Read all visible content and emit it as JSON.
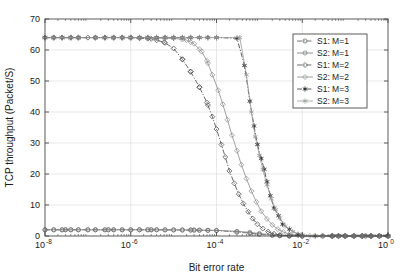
{
  "chart_data": {
    "type": "line",
    "title": "",
    "xlabel": "Bit error rate",
    "ylabel": "TCP throughput (Packet/S)",
    "xscale": "log",
    "yscale": "linear",
    "xlim": [
      1e-08,
      1
    ],
    "ylim": [
      0,
      70
    ],
    "grid": true,
    "legend_position": "upper-right",
    "xticks": [
      {
        "value": 1e-08,
        "label": "10",
        "exponent": "-8"
      },
      {
        "value": 1e-06,
        "label": "10",
        "exponent": "-6"
      },
      {
        "value": 0.0001,
        "label": "10",
        "exponent": "-4"
      },
      {
        "value": 0.01,
        "label": "10",
        "exponent": "-2"
      },
      {
        "value": 1,
        "label": "10",
        "exponent": "0"
      }
    ],
    "yticks": [
      0,
      10,
      20,
      30,
      40,
      50,
      60,
      70
    ],
    "plateau_value": 64,
    "series": [
      {
        "name": "S1: M=1",
        "marker": "circle",
        "filled": false,
        "linestyle": "dashdot",
        "color": "#555555",
        "x": [
          1e-08,
          3e-08,
          1e-07,
          3e-07,
          1e-06,
          3e-06,
          1e-05,
          3e-05,
          0.0001,
          0.0003,
          0.0006,
          0.001,
          0.002,
          0.003,
          0.005,
          0.01,
          0.03,
          0.1,
          0.3,
          1
        ],
        "y": [
          2.0,
          2.0,
          2.0,
          2.0,
          2.0,
          2.0,
          1.95,
          1.9,
          1.75,
          1.3,
          0.9,
          0.55,
          0.2,
          0.08,
          0.02,
          0,
          0,
          0,
          0,
          0
        ]
      },
      {
        "name": "S2: M=1",
        "marker": "circle",
        "filled": false,
        "linestyle": "solid",
        "color": "#777777",
        "x": [
          1e-08,
          3e-08,
          1e-07,
          3e-07,
          1e-06,
          3e-06,
          1e-05,
          3e-05,
          0.0001,
          0.0003,
          0.0006,
          0.001,
          0.002,
          0.003,
          0.005,
          0.01,
          0.03,
          0.1,
          0.3,
          1
        ],
        "y": [
          2.0,
          2.0,
          2.0,
          2.0,
          2.0,
          2.0,
          1.98,
          1.93,
          1.82,
          1.5,
          1.15,
          0.8,
          0.35,
          0.15,
          0.05,
          0,
          0,
          0,
          0,
          0
        ]
      },
      {
        "name": "S1: M=2",
        "marker": "diamond",
        "filled": false,
        "linestyle": "dashdot",
        "color": "#444444",
        "x": [
          1e-08,
          1e-07,
          1e-06,
          3e-06,
          6e-06,
          1e-05,
          1.6e-05,
          2.5e-05,
          4e-05,
          6e-05,
          8e-05,
          0.0001,
          0.00013,
          0.00016,
          0.0002,
          0.00026,
          0.00033,
          0.00042,
          0.00055,
          0.0007,
          0.0009,
          0.0012,
          0.0016,
          0.0022,
          0.003,
          0.005,
          0.01,
          0.1,
          1
        ],
        "y": [
          64,
          64,
          64,
          63.6,
          62.5,
          60.5,
          57.0,
          53.0,
          48.0,
          43.0,
          38.5,
          34.5,
          29.5,
          25.5,
          21.0,
          17.0,
          13.5,
          10.5,
          7.8,
          5.6,
          3.8,
          2.4,
          1.4,
          0.7,
          0.3,
          0.05,
          0,
          0,
          0
        ]
      },
      {
        "name": "S2: M=2",
        "marker": "diamond",
        "filled": false,
        "linestyle": "solid",
        "color": "#8a8a8a",
        "x": [
          1e-08,
          1e-07,
          1e-06,
          1e-05,
          2e-05,
          3e-05,
          4.5e-05,
          6e-05,
          8e-05,
          0.00011,
          0.00014,
          0.00018,
          0.00023,
          0.0003,
          0.00038,
          0.0005,
          0.00065,
          0.00085,
          0.0011,
          0.0015,
          0.002,
          0.0027,
          0.0036,
          0.005,
          0.008,
          0.015,
          0.1,
          1
        ],
        "y": [
          64,
          64,
          64,
          63.8,
          63.2,
          62.0,
          59.5,
          56.5,
          52.0,
          47.0,
          42.5,
          37.5,
          32.5,
          27.5,
          23.0,
          18.5,
          14.5,
          11.0,
          8.0,
          5.5,
          3.6,
          2.2,
          1.3,
          0.6,
          0.2,
          0.03,
          0,
          0
        ]
      },
      {
        "name": "S1: M=3",
        "marker": "star",
        "filled": true,
        "linestyle": "dashdot",
        "color": "#333333",
        "x": [
          1e-08,
          1e-06,
          1e-05,
          0.0001,
          0.0003,
          0.00045,
          0.0006,
          0.00075,
          0.0009,
          0.0011,
          0.0013,
          0.0015,
          0.0018,
          0.0022,
          0.0028,
          0.0035,
          0.005,
          0.008,
          0.02,
          0.1,
          1
        ],
        "y": [
          64,
          64,
          64,
          64,
          63.8,
          55.0,
          43.5,
          35.5,
          29.5,
          25.0,
          21.5,
          17.5,
          13.0,
          9.0,
          6.5,
          3.8,
          2.2,
          0.5,
          0,
          0,
          0
        ]
      },
      {
        "name": "S2: M=3",
        "marker": "star",
        "filled": false,
        "linestyle": "solid",
        "color": "#9a9a9a",
        "x": [
          1e-08,
          1e-06,
          1e-05,
          0.0001,
          0.00035,
          0.0005,
          0.00065,
          0.0008,
          0.001,
          0.0012,
          0.0015,
          0.0019,
          0.0024,
          0.003,
          0.004,
          0.006,
          0.01,
          0.03,
          0.1,
          1
        ],
        "y": [
          64,
          64,
          64,
          64,
          64,
          52.0,
          40.0,
          32.0,
          26.0,
          21.5,
          16.5,
          12.0,
          8.5,
          5.8,
          3.2,
          1.4,
          0.3,
          0,
          0,
          0
        ]
      }
    ],
    "legend_entries": [
      "S1: M=1",
      "S2: M=1",
      "S1: M=2",
      "S2: M=2",
      "S1: M=3",
      "S2: M=3"
    ]
  }
}
